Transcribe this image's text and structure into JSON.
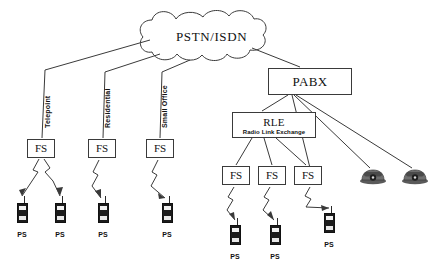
{
  "diagram": {
    "background": "#ffffff",
    "stroke": "#3a3a3a",
    "text_color": "#111111"
  },
  "cloud": {
    "label": "PSTN/ISDN",
    "x": 150,
    "y": 8,
    "w": 128,
    "h": 56
  },
  "pabx": {
    "label": "PABX",
    "x": 268,
    "y": 68,
    "w": 84,
    "h": 27
  },
  "rle": {
    "title": "RLE",
    "subtitle": "Radio Link Exchange",
    "x": 232,
    "y": 112,
    "w": 84,
    "h": 26
  },
  "link_labels": [
    {
      "text": "Telepoint",
      "x": 44,
      "y": 128
    },
    {
      "text": "Residential",
      "x": 104,
      "y": 128
    },
    {
      "text": "Small Office",
      "x": 161,
      "y": 128
    }
  ],
  "fs_boxes": [
    {
      "label": "FS",
      "x": 27,
      "y": 139,
      "w": 28,
      "h": 19,
      "group": "telepoint"
    },
    {
      "label": "FS",
      "x": 88,
      "y": 139,
      "w": 28,
      "h": 19,
      "group": "residential"
    },
    {
      "label": "FS",
      "x": 146,
      "y": 139,
      "w": 28,
      "h": 19,
      "group": "small-office"
    },
    {
      "label": "FS",
      "x": 222,
      "y": 166,
      "w": 28,
      "h": 19,
      "group": "rle-1"
    },
    {
      "label": "FS",
      "x": 258,
      "y": 166,
      "w": 28,
      "h": 19,
      "group": "rle-2"
    },
    {
      "label": "FS",
      "x": 294,
      "y": 166,
      "w": 28,
      "h": 19,
      "group": "rle-3"
    }
  ],
  "ps_units": [
    {
      "label": "PS",
      "x": 15,
      "y": 196
    },
    {
      "label": "PS",
      "x": 53,
      "y": 196
    },
    {
      "label": "PS",
      "x": 96,
      "y": 196
    },
    {
      "label": "PS",
      "x": 160,
      "y": 196
    },
    {
      "label": "PS",
      "x": 228,
      "y": 218
    },
    {
      "label": "PS",
      "x": 268,
      "y": 218
    },
    {
      "label": "PS",
      "x": 322,
      "y": 206
    }
  ],
  "telephones": [
    {
      "name": "telephone-1",
      "x": 360,
      "y": 168
    },
    {
      "name": "telephone-2",
      "x": 402,
      "y": 168
    }
  ]
}
